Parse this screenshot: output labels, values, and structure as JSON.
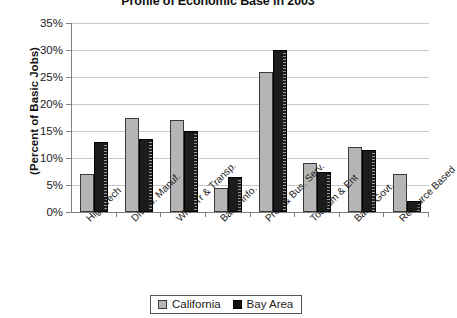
{
  "chart_data": {
    "type": "bar",
    "title": "Profile of Economic Base in 2003",
    "xlabel": "",
    "ylabel": "(Percent of Basic Jobs)",
    "ylim": [
      0,
      35
    ],
    "ytick_step": 5,
    "ytick_labels": [
      "0%",
      "5%",
      "10%",
      "15%",
      "20%",
      "25%",
      "30%",
      "35%"
    ],
    "grid": true,
    "legend_position": "bottom",
    "categories": [
      "High Tech",
      "Divers. Manuf.",
      "Whsl Tr & Transp.",
      "Basic Info.",
      "Prof. & Bus. Serv.",
      "Tourism & Ent",
      "Basic Govt.",
      "Resource Based"
    ],
    "series": [
      {
        "name": "California",
        "color": "#b5b5b5",
        "values": [
          7.0,
          17.5,
          17.0,
          4.5,
          26.0,
          9.0,
          12.0,
          7.0
        ]
      },
      {
        "name": "Bay Area",
        "color": "#1c1c1c",
        "values": [
          13.0,
          13.5,
          15.0,
          6.5,
          30.0,
          7.5,
          11.5,
          2.0
        ]
      }
    ]
  },
  "legend": {
    "items": [
      {
        "label": "California"
      },
      {
        "label": "Bay Area"
      }
    ]
  }
}
